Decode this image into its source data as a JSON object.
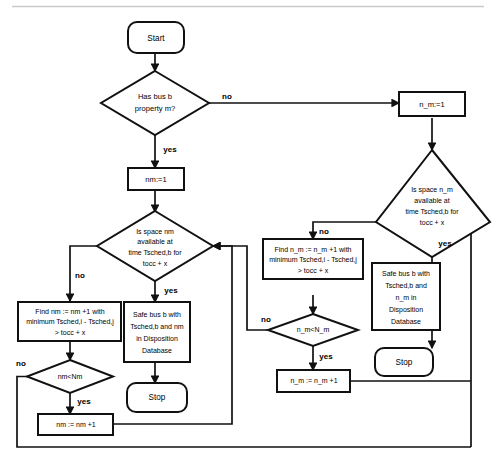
{
  "diagram": {
    "type": "flowchart",
    "colors": {
      "stroke": "#111111",
      "fill": "#ffffff",
      "background": "#ffffff",
      "divider": "#c9c9c9"
    },
    "nodes": {
      "start": {
        "label": "Start",
        "shape": "terminator"
      },
      "has_property": {
        "shape": "decision",
        "line1": "Has bus b",
        "line2": "property m?"
      },
      "nm_init": {
        "label": "nm:=1",
        "shape": "process"
      },
      "n_m_init": {
        "label": "n_m:=1",
        "shape": "process"
      },
      "is_space_nm": {
        "shape": "decision",
        "line1": "Is space nm",
        "line2": "available at",
        "line3": "time Tsched,b for",
        "line4": "tocc + x"
      },
      "is_space_n_m": {
        "shape": "decision",
        "line1": "Is space n_m",
        "line2": "available at",
        "line3": "time Tsched,b for",
        "line4": "tocc + x"
      },
      "find_nm": {
        "shape": "process",
        "line1": "Find nm := nm +1 with",
        "line2": "minimum Tsched,i - Tsched,j",
        "line3": "> tocc + x"
      },
      "find_n_m": {
        "shape": "process",
        "line1": "Find n_m := n_m +1 with",
        "line2": "minimum Tsched,i - Tsched,j",
        "line3": "> tocc + x"
      },
      "safe_nm": {
        "shape": "process",
        "line1": "Safe bus b with",
        "line2": "Tsched,b and nm",
        "line3": "in Disposition",
        "line4": "Database"
      },
      "safe_n_m": {
        "shape": "process",
        "line1": "Safe bus b with",
        "line2": "Tsched,b and",
        "line3": "n_m  in",
        "line4": "Disposition",
        "line5": "Database"
      },
      "nm_lt_Nm": {
        "label": "nm<Nm",
        "shape": "decision"
      },
      "n_m_lt_N_m": {
        "label": "n_m<N_m",
        "shape": "decision"
      },
      "nm_incr": {
        "label": "nm := nm +1",
        "shape": "process"
      },
      "n_m_incr": {
        "label": "n_m := n_m +1",
        "shape": "process"
      },
      "stop_left": {
        "label": "Stop",
        "shape": "terminator"
      },
      "stop_right": {
        "label": "Stop",
        "shape": "terminator"
      }
    },
    "edge_labels": {
      "has_property_no": "no",
      "has_property_yes": "yes",
      "is_space_nm_no": "no",
      "is_space_nm_yes": "yes",
      "is_space_n_m_no": "no",
      "is_space_n_m_yes": "yes",
      "nm_lt_Nm_no": "no",
      "nm_lt_Nm_yes": "yes",
      "n_m_lt_N_m_no": "no",
      "n_m_lt_N_m_yes": "yes"
    }
  }
}
